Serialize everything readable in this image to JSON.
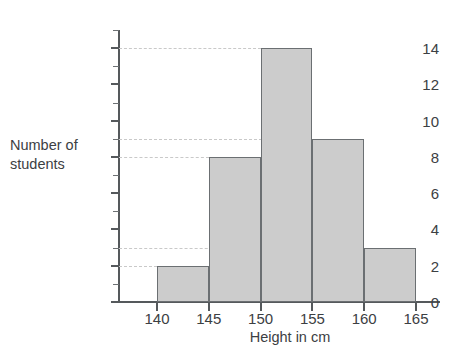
{
  "chart_data": {
    "type": "bar",
    "title": "",
    "xlabel": "Height in cm",
    "ylabel": "Number of students",
    "ylabel_line1": "Number of",
    "ylabel_line2": "students",
    "categories": [
      "140-145",
      "145-150",
      "150-155",
      "155-160",
      "160-165"
    ],
    "bin_edges": [
      140,
      145,
      150,
      155,
      160,
      165
    ],
    "values": [
      2,
      8,
      14,
      9,
      3
    ],
    "ylim": [
      0,
      15
    ],
    "xlim": [
      137.5,
      168
    ],
    "y_ticks": [
      0,
      2,
      4,
      6,
      8,
      10,
      12,
      14
    ],
    "y_tick_labels": [
      "0",
      "2",
      "4",
      "6",
      "8",
      "10",
      "12",
      "14"
    ],
    "y_minor_ticks": [
      1,
      3,
      5,
      7,
      9,
      11,
      13,
      15
    ],
    "x_ticks": [
      140,
      145,
      150,
      155,
      160,
      165
    ],
    "x_tick_labels": [
      "140",
      "145",
      "150",
      "155",
      "160",
      "165"
    ],
    "gridlines_at": [
      2,
      3,
      8,
      9,
      14
    ],
    "grid": true,
    "legend": "none",
    "bar_fill_color": "#cccccc",
    "bar_edge_color": "#6b6f72",
    "axis_color": "#55595c",
    "grid_color": "#c9c9c9",
    "text_color": "#3c4043"
  }
}
